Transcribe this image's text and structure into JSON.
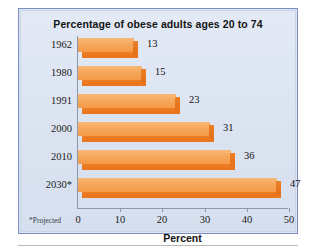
{
  "chart_data": {
    "type": "bar",
    "orientation": "horizontal",
    "title": "Percentage of obese adults ages 20 to 74",
    "xlabel": "Percent",
    "ylabel": "",
    "categories": [
      "1962",
      "1980",
      "1991",
      "2000",
      "2010",
      "2030*"
    ],
    "values": [
      13,
      15,
      23,
      31,
      36,
      47
    ],
    "xlim": [
      0,
      50
    ],
    "xticks": [
      0,
      10,
      20,
      30,
      40,
      50
    ],
    "xtick_labels": [
      "0",
      "10",
      "20",
      "30",
      "40",
      "50"
    ],
    "grid": false,
    "legend": false,
    "footnote": "*Projected",
    "bar_color": "#f5a54e",
    "bar_shadow_color": "#ec7a1e",
    "panel_background": "#dde5f3",
    "panel_border": "#7b8fc4"
  },
  "rows": [
    {
      "label": "1962",
      "value": 13,
      "value_label": "13"
    },
    {
      "label": "1980",
      "value": 15,
      "value_label": "15"
    },
    {
      "label": "1991",
      "value": 23,
      "value_label": "23"
    },
    {
      "label": "2000",
      "value": 31,
      "value_label": "31"
    },
    {
      "label": "2010",
      "value": 36,
      "value_label": "36"
    },
    {
      "label": "2030*",
      "value": 47,
      "value_label": "47"
    }
  ],
  "ticks": [
    {
      "label": "0"
    },
    {
      "label": "10"
    },
    {
      "label": "20"
    },
    {
      "label": "30"
    },
    {
      "label": "40"
    },
    {
      "label": "50"
    }
  ]
}
